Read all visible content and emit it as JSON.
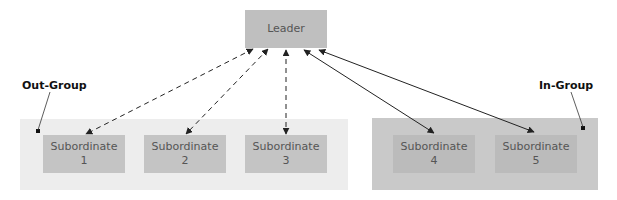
{
  "diagram": {
    "type": "leader-member exchange",
    "leader": {
      "label": "Leader"
    },
    "groups": [
      {
        "name": "out-group",
        "label": "Out-Group",
        "link_style": "dashed",
        "subordinates": [
          {
            "line1": "Subordinate",
            "line2": "1"
          },
          {
            "line1": "Subordinate",
            "line2": "2"
          },
          {
            "line1": "Subordinate",
            "line2": "3"
          }
        ]
      },
      {
        "name": "in-group",
        "label": "In-Group",
        "link_style": "solid",
        "subordinates": [
          {
            "line1": "Subordinate",
            "line2": "4"
          },
          {
            "line1": "Subordinate",
            "line2": "5"
          }
        ]
      }
    ],
    "colors": {
      "leader_box": "#bfbfbf",
      "out_group_panel": "#ededed",
      "in_group_panel": "#c9c9c9",
      "subordinate_box": "#c4c4c4",
      "arrows": "#222222"
    }
  }
}
